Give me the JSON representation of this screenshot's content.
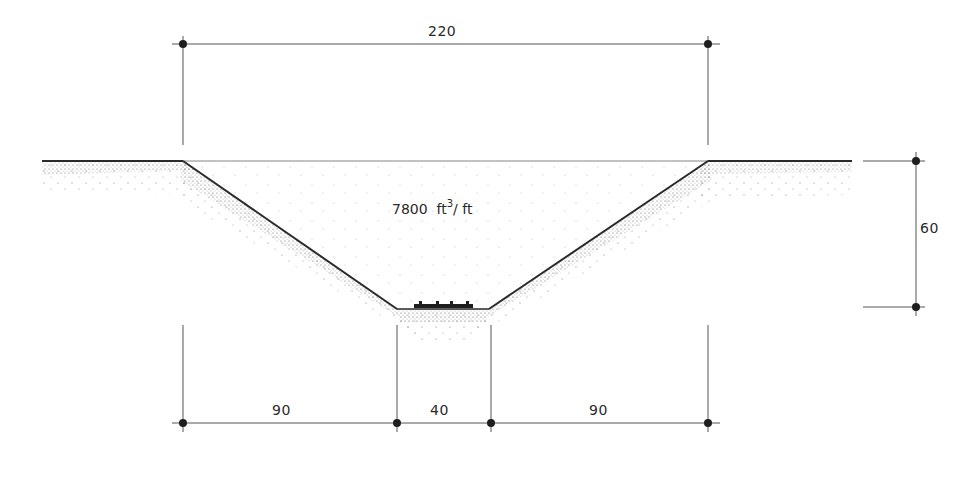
{
  "diagram": {
    "type": "trapezoidal-cut-cross-section",
    "volume": {
      "value": "7800",
      "unit_base": "ft",
      "unit_exp": "3",
      "unit_per": "/ ft"
    },
    "dimensions": {
      "top_width": "220",
      "depth": "60",
      "left_slope_run": "90",
      "bottom_width": "40",
      "right_slope_run": "90"
    },
    "colors": {
      "line": "#2a2a2a",
      "dim_line": "#555555",
      "stipple": "#333333"
    }
  }
}
